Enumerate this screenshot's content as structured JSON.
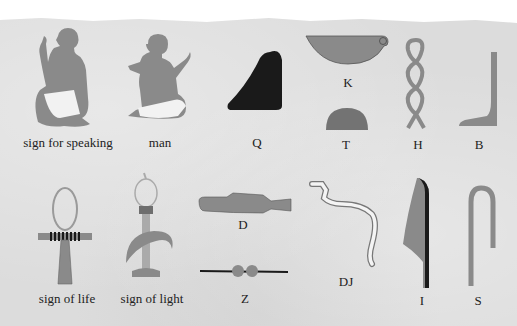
{
  "colors": {
    "paper": "#dcdcdc",
    "glyph_gray": "#8a8a8a",
    "glyph_dark": "#1a1a1a",
    "loincloth": "#f2f2f2",
    "text": "#222222"
  },
  "glyphs": [
    {
      "id": "sign-for-speaking",
      "label": "sign for speaking"
    },
    {
      "id": "man",
      "label": "man"
    },
    {
      "id": "q",
      "label": "Q"
    },
    {
      "id": "k",
      "label": "K"
    },
    {
      "id": "t",
      "label": "T"
    },
    {
      "id": "h",
      "label": "H"
    },
    {
      "id": "b",
      "label": "B"
    },
    {
      "id": "sign-of-life",
      "label": "sign of life"
    },
    {
      "id": "sign-of-light",
      "label": "sign of light"
    },
    {
      "id": "d",
      "label": "D"
    },
    {
      "id": "z",
      "label": "Z"
    },
    {
      "id": "dj",
      "label": "DJ"
    },
    {
      "id": "i",
      "label": "I"
    },
    {
      "id": "s",
      "label": "S"
    }
  ]
}
